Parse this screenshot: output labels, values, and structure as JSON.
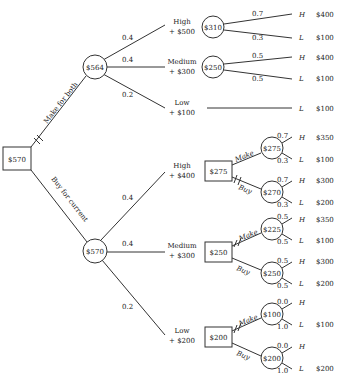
{
  "root": {
    "value": "$570",
    "type": "decision"
  },
  "decisions": {
    "make_for_both": "Make for both",
    "buy_for_current": "Buy for current"
  },
  "upper": {
    "chance_value": "$564",
    "branches": [
      {
        "prob": "0.4",
        "label": "High",
        "sub": "+ $500",
        "node": "$310",
        "outcomes": [
          {
            "prob": "0.7",
            "state": "H",
            "value": "$400"
          },
          {
            "prob": "0.3",
            "state": "L",
            "value": "$100"
          }
        ]
      },
      {
        "prob": "0.4",
        "label": "Medium",
        "sub": "+ $300",
        "node": "$250",
        "outcomes": [
          {
            "prob": "0.5",
            "state": "H",
            "value": "$400"
          },
          {
            "prob": "0.5",
            "state": "L",
            "value": "$100"
          }
        ]
      },
      {
        "prob": "0.2",
        "label": "Low",
        "sub": "+ $100",
        "outcomes": [
          {
            "state": "L",
            "value": "$100"
          }
        ]
      }
    ]
  },
  "lower": {
    "chance_value": "$570",
    "branches": [
      {
        "prob": "0.4",
        "label": "High",
        "sub": "+ $400",
        "decision": "$275",
        "make": {
          "label": "Make",
          "node": "$275",
          "outcomes": [
            {
              "prob": "0.7",
              "state": "H",
              "value": "$350"
            },
            {
              "prob": "0.3",
              "state": "L",
              "value": "$100"
            }
          ]
        },
        "buy": {
          "label": "Buy",
          "node": "$270",
          "outcomes": [
            {
              "prob": "0.7",
              "state": "H",
              "value": "$300"
            },
            {
              "prob": "0.3",
              "state": "L",
              "value": "$200"
            }
          ]
        }
      },
      {
        "prob": "0.4",
        "label": "Medium",
        "sub": "+ $300",
        "decision": "$250",
        "make": {
          "label": "Make",
          "node": "$225",
          "outcomes": [
            {
              "prob": "0.5",
              "state": "H",
              "value": "$350"
            },
            {
              "prob": "0.5",
              "state": "L",
              "value": "$100"
            }
          ]
        },
        "buy": {
          "label": "Buy",
          "node": "$250",
          "outcomes": [
            {
              "prob": "0.5",
              "state": "H",
              "value": "$300"
            },
            {
              "prob": "0.5",
              "state": "L",
              "value": "$200"
            }
          ]
        }
      },
      {
        "prob": "0.2",
        "label": "Low",
        "sub": "+ $200",
        "decision": "$200",
        "make": {
          "label": "Make",
          "node": "$100",
          "outcomes": [
            {
              "prob": "0.0",
              "state": "H",
              "value": ""
            },
            {
              "prob": "1.0",
              "state": "L",
              "value": "$100"
            }
          ]
        },
        "buy": {
          "label": "Buy",
          "node": "$200",
          "outcomes": [
            {
              "prob": "0.0",
              "state": "H",
              "value": ""
            },
            {
              "prob": "1.0",
              "state": "L",
              "value": "$200"
            }
          ]
        }
      }
    ]
  }
}
